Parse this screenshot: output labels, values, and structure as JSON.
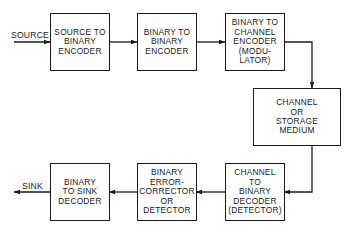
{
  "diagram": {
    "type": "block-diagram",
    "title": "",
    "input_label": "SOURCE",
    "output_label": "SINK",
    "blocks": [
      {
        "id": "b1",
        "lines": [
          "SOURCE TO",
          "BINARY",
          "ENCODER"
        ]
      },
      {
        "id": "b2",
        "lines": [
          "BINARY TO",
          "BINARY",
          "ENCODER"
        ]
      },
      {
        "id": "b3",
        "lines": [
          "BINARY TO",
          "CHANNEL",
          "ENCODER",
          "(MODU-",
          "LATOR)"
        ]
      },
      {
        "id": "b4",
        "lines": [
          "CHANNEL",
          "OR",
          "STORAGE",
          "MEDIUM"
        ]
      },
      {
        "id": "b5",
        "lines": [
          "CHANNEL",
          "TO",
          "BINARY",
          "DECODER",
          "(DETECTOR)"
        ]
      },
      {
        "id": "b6",
        "lines": [
          "BINARY",
          "ERROR-",
          "CORRECTOR",
          "OR",
          "DETECTOR"
        ]
      },
      {
        "id": "b7",
        "lines": [
          "BINARY",
          "TO SINK",
          "DECODER"
        ]
      }
    ],
    "edges": [
      [
        "SOURCE",
        "b1"
      ],
      [
        "b1",
        "b2"
      ],
      [
        "b2",
        "b3"
      ],
      [
        "b3",
        "b4"
      ],
      [
        "b4",
        "b5"
      ],
      [
        "b5",
        "b6"
      ],
      [
        "b6",
        "b7"
      ],
      [
        "b7",
        "SINK"
      ]
    ]
  }
}
